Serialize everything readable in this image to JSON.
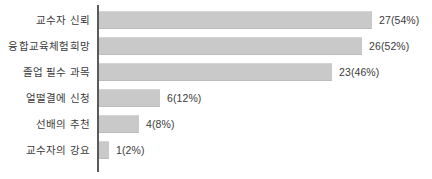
{
  "chart_data": {
    "type": "bar",
    "orientation": "horizontal",
    "title": "",
    "xlabel": "",
    "ylabel": "",
    "grid": false,
    "legend": null,
    "xlim": [
      0,
      27
    ],
    "categories": [
      "교수자 신뢰",
      "융합교육체험희망",
      "졸업 필수 과목",
      "얼떨결에 신청",
      "선배의 추천",
      "교수자의 강요"
    ],
    "values": [
      27,
      26,
      23,
      6,
      4,
      1
    ],
    "percents": [
      54,
      52,
      46,
      12,
      8,
      2
    ],
    "data_labels": [
      "27(54%)",
      "26(52%)",
      "23(46%)",
      "6(12%)",
      "4(8%)",
      "1(2%)"
    ],
    "bars": [
      {
        "label": "교수자 신뢰",
        "value": 27,
        "percent": 54,
        "data_label": "27(54%)"
      },
      {
        "label": "융합교육체험희망",
        "value": 26,
        "percent": 52,
        "data_label": "26(52%)"
      },
      {
        "label": "졸업 필수 과목",
        "value": 23,
        "percent": 46,
        "data_label": "23(46%)"
      },
      {
        "label": "얼떨결에 신청",
        "value": 6,
        "percent": 12,
        "data_label": "6(12%)"
      },
      {
        "label": "선배의 추천",
        "value": 4,
        "percent": 8,
        "data_label": "4(8%)"
      },
      {
        "label": "교수자의 강요",
        "value": 1,
        "percent": 2,
        "data_label": "1(2%)"
      }
    ],
    "colors": {
      "bar_fill": "#c9c9c9",
      "axis_line": "#5a5a5a",
      "text": "#3b3b3b",
      "background": "#ffffff"
    }
  }
}
